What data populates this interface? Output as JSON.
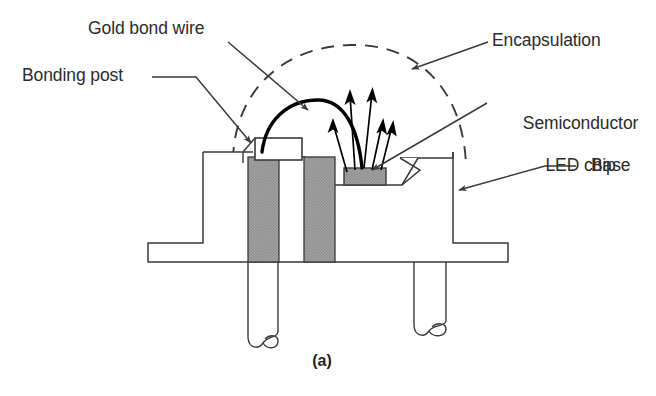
{
  "figure": {
    "caption": "(a)",
    "type": "cross-section schematic of a packaged light-emitting diode lamp"
  },
  "labels": {
    "gold_bond_wire": "Gold bond wire",
    "bonding_post": "Bonding post",
    "encapsulation": "Encapsulation",
    "semiconductor_led_chip_line1": "Semiconductor",
    "semiconductor_led_chip_line2": "LED chip",
    "base": "Base"
  },
  "colors": {
    "line": "#3a3a3a",
    "text": "#2b2b2b",
    "hatch_fill": "#9a9a9a",
    "wire": "#000000",
    "background": "#ffffff"
  },
  "parts": {
    "encapsulation_style": "dashed dome arc",
    "bond_wire_style": "thick solid arc",
    "light_rays_count": 5,
    "leads_count": 2,
    "lead_end_style": "break squiggle"
  }
}
